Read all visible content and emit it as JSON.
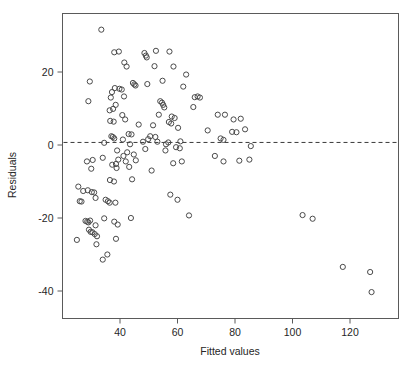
{
  "chart_data": {
    "type": "scatter",
    "title": "",
    "xlabel": "Fitted values",
    "ylabel": "Residuals",
    "xlim": [
      23,
      130
    ],
    "ylim": [
      -43,
      33
    ],
    "xticks": [
      40,
      60,
      80,
      100,
      120
    ],
    "xtick_labels": [
      "40",
      "60",
      "80",
      "100",
      "120"
    ],
    "yticks": [
      20,
      0,
      -20,
      -40
    ],
    "ytick_labels": [
      "20",
      "0",
      "-20",
      "-40"
    ],
    "grid": false,
    "legend": null,
    "marker": "open-circle",
    "marker_color": "#4a4a4a",
    "reference_line": {
      "type": "horizontal-dashed",
      "y": 0.7,
      "label": ""
    },
    "points": [
      [
        33.5,
        31.6
      ],
      [
        38.0,
        25.4
      ],
      [
        39.6,
        25.6
      ],
      [
        48.5,
        25.2
      ],
      [
        49.0,
        24.5
      ],
      [
        49.3,
        24.0
      ],
      [
        52.5,
        25.8
      ],
      [
        57.2,
        25.6
      ],
      [
        41.5,
        22.6
      ],
      [
        42.3,
        21.5
      ],
      [
        52.0,
        21.6
      ],
      [
        58.6,
        21.5
      ],
      [
        63.0,
        19.3
      ],
      [
        29.5,
        17.4
      ],
      [
        38.2,
        15.6
      ],
      [
        39.8,
        15.4
      ],
      [
        40.6,
        15.2
      ],
      [
        44.5,
        17.0
      ],
      [
        45.0,
        16.6
      ],
      [
        45.4,
        16.3
      ],
      [
        49.5,
        16.7
      ],
      [
        54.8,
        17.6
      ],
      [
        62.0,
        16.0
      ],
      [
        29.0,
        12.0
      ],
      [
        37.2,
        14.5
      ],
      [
        36.8,
        13.0
      ],
      [
        41.4,
        13.3
      ],
      [
        66.0,
        13.1
      ],
      [
        67.0,
        13.3
      ],
      [
        67.8,
        13.0
      ],
      [
        38.5,
        11.0
      ],
      [
        54.0,
        12.0
      ],
      [
        54.6,
        11.6
      ],
      [
        55.0,
        11.0
      ],
      [
        55.4,
        10.3
      ],
      [
        65.5,
        10.4
      ],
      [
        36.4,
        9.5
      ],
      [
        37.6,
        9.9
      ],
      [
        40.8,
        8.2
      ],
      [
        53.5,
        8.3
      ],
      [
        58.0,
        7.8
      ],
      [
        59.0,
        7.4
      ],
      [
        36.6,
        6.6
      ],
      [
        37.8,
        6.4
      ],
      [
        41.8,
        7.0
      ],
      [
        57.0,
        6.3
      ],
      [
        57.8,
        5.9
      ],
      [
        74.0,
        8.3
      ],
      [
        76.5,
        8.3
      ],
      [
        79.5,
        7.0
      ],
      [
        82.0,
        7.2
      ],
      [
        46.5,
        5.6
      ],
      [
        51.5,
        5.4
      ],
      [
        60.2,
        4.7
      ],
      [
        70.5,
        4.0
      ],
      [
        43.0,
        3.0
      ],
      [
        44.0,
        2.9
      ],
      [
        50.5,
        2.4
      ],
      [
        52.3,
        2.2
      ],
      [
        79.0,
        3.6
      ],
      [
        80.5,
        3.5
      ],
      [
        83.5,
        4.3
      ],
      [
        37.0,
        2.4
      ],
      [
        37.5,
        2.2
      ],
      [
        38.0,
        1.8
      ],
      [
        41.0,
        1.5
      ],
      [
        48.0,
        0.9
      ],
      [
        49.8,
        1.6
      ],
      [
        56.8,
        0.7
      ],
      [
        61.0,
        1.0
      ],
      [
        75.0,
        1.8
      ],
      [
        76.0,
        1.4
      ],
      [
        34.5,
        0.6
      ],
      [
        43.5,
        0.2
      ],
      [
        53.0,
        0.9
      ],
      [
        56.0,
        0.2
      ],
      [
        59.5,
        -0.6
      ],
      [
        60.8,
        -0.9
      ],
      [
        85.5,
        -0.3
      ],
      [
        39.0,
        -1.5
      ],
      [
        42.5,
        -2.0
      ],
      [
        44.8,
        -2.6
      ],
      [
        48.8,
        -1.1
      ],
      [
        55.8,
        -1.5
      ],
      [
        34.0,
        -3.5
      ],
      [
        41.2,
        -3.0
      ],
      [
        42.0,
        -4.5
      ],
      [
        45.5,
        -4.2
      ],
      [
        58.5,
        -5.0
      ],
      [
        61.5,
        -4.5
      ],
      [
        28.5,
        -4.5
      ],
      [
        30.5,
        -4.1
      ],
      [
        37.3,
        -5.4
      ],
      [
        38.6,
        -5.2
      ],
      [
        39.4,
        -4.0
      ],
      [
        73.0,
        -3.0
      ],
      [
        76.0,
        -4.5
      ],
      [
        81.5,
        -4.3
      ],
      [
        85.0,
        -4.0
      ],
      [
        30.0,
        -6.5
      ],
      [
        38.8,
        -6.3
      ],
      [
        43.2,
        -6.0
      ],
      [
        51.0,
        -7.0
      ],
      [
        36.5,
        -9.6
      ],
      [
        37.9,
        -10.0
      ],
      [
        44.2,
        -9.4
      ],
      [
        25.5,
        -11.4
      ],
      [
        27.2,
        -12.6
      ],
      [
        28.8,
        -12.4
      ],
      [
        30.2,
        -12.9
      ],
      [
        31.0,
        -13.0
      ],
      [
        57.5,
        -13.6
      ],
      [
        26.0,
        -15.4
      ],
      [
        26.6,
        -15.5
      ],
      [
        31.5,
        -14.5
      ],
      [
        35.0,
        -15.0
      ],
      [
        35.8,
        -15.4
      ],
      [
        36.4,
        -15.8
      ],
      [
        38.4,
        -15.8
      ],
      [
        60.0,
        -15.0
      ],
      [
        28.0,
        -20.8
      ],
      [
        28.6,
        -21.0
      ],
      [
        29.0,
        -21.2
      ],
      [
        29.6,
        -20.7
      ],
      [
        34.5,
        -20.1
      ],
      [
        38.0,
        -21.0
      ],
      [
        39.2,
        -21.8
      ],
      [
        43.8,
        -20.0
      ],
      [
        31.5,
        -22.0
      ],
      [
        64.0,
        -19.3
      ],
      [
        103.5,
        -19.2
      ],
      [
        107.0,
        -20.2
      ],
      [
        29.2,
        -23.2
      ],
      [
        29.8,
        -23.8
      ],
      [
        30.4,
        -23.9
      ],
      [
        31.2,
        -24.4
      ],
      [
        25.0,
        -26.0
      ],
      [
        32.0,
        -25.0
      ],
      [
        38.6,
        -25.7
      ],
      [
        31.8,
        -27.2
      ],
      [
        34.0,
        -31.4
      ],
      [
        35.6,
        -30.0
      ],
      [
        117.5,
        -33.4
      ],
      [
        127.0,
        -34.8
      ],
      [
        127.5,
        -40.3
      ]
    ]
  },
  "figure": {
    "background": "#ffffff",
    "frame_color": "#5a5a5a",
    "axis_text_color": "#262626"
  }
}
